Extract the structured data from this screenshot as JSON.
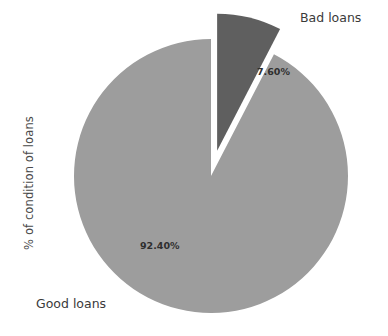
{
  "chart_data": {
    "type": "pie",
    "title": "",
    "xlabel": "",
    "ylabel": "% of condition of loans",
    "categories": [
      "Good loans",
      "Bad loans"
    ],
    "values": [
      92.4,
      7.6
    ],
    "value_labels": [
      "92.40%",
      "7.60%"
    ],
    "units": "%",
    "legend": "none",
    "grid": false,
    "slices": [
      {
        "name": "Good loans",
        "value": 92.4,
        "value_label": "92.40%",
        "color": "#9d9d9d",
        "exploded": false
      },
      {
        "name": "Bad loans",
        "value": 7.6,
        "value_label": "7.60%",
        "color": "#5f5f5f",
        "exploded": true
      }
    ]
  },
  "labels": {
    "axis_vertical": "% of condition of loans",
    "bad_loans": "Bad loans",
    "good_loans": "Good loans",
    "bad_value": "7.60%",
    "good_value": "92.40%"
  },
  "colors": {
    "background": "#ffffff",
    "good_slice": "#9d9d9d",
    "bad_slice": "#5f5f5f",
    "text": "#3a3a3a"
  }
}
